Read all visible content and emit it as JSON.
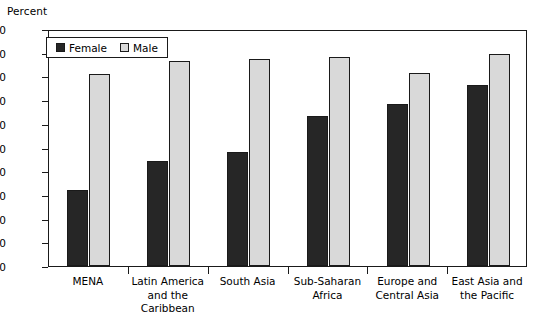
{
  "chart_data": {
    "type": "bar",
    "title": "",
    "xlabel": "",
    "ylabel": "Percent",
    "ylim": [
      0,
      100
    ],
    "ytick_step": 10,
    "yticks": [
      0,
      10,
      20,
      30,
      40,
      50,
      60,
      70,
      80,
      90,
      100
    ],
    "grid": false,
    "legend_position": "top-left inside plot",
    "categories": [
      "MENA",
      "Latin America\nand the Caribbean",
      "South Asia",
      "Sub-Saharan\nAfrica",
      "Europe and\nCentral Asia",
      "East Asia and\nthe Pacific"
    ],
    "series": [
      {
        "name": "Female",
        "color": "#262626",
        "values": [
          32,
          44.5,
          48,
          63.5,
          68.5,
          76.5
        ]
      },
      {
        "name": "Male",
        "color": "#d9d9d9",
        "values": [
          81,
          86.5,
          87.5,
          88,
          81.5,
          89.5
        ]
      }
    ]
  },
  "axis": {
    "y_title": "Percent",
    "y_tick_labels": [
      "100",
      "90",
      "80",
      "70",
      "60",
      "50",
      "40",
      "30",
      "20",
      "10",
      "0"
    ]
  },
  "legend": {
    "items": [
      {
        "label": "Female",
        "swatch": "female"
      },
      {
        "label": "Male",
        "swatch": "male"
      }
    ]
  }
}
